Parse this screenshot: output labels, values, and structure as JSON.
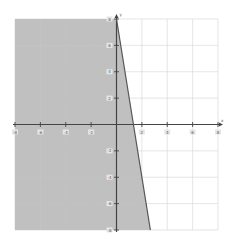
{
  "chart_data": {
    "type": "area",
    "title": "",
    "xlabel": "x",
    "ylabel": "y",
    "xlim": [
      -8,
      8
    ],
    "ylim": [
      -8,
      8
    ],
    "grid": true,
    "x_ticks": [
      -8,
      -6,
      -4,
      -2,
      2,
      4,
      6,
      8
    ],
    "y_ticks": [
      8,
      6,
      4,
      2,
      -2,
      -4,
      -6,
      -8
    ],
    "x_tick_labels": [
      "-8",
      "-6",
      "-4",
      "-2",
      "2",
      "4",
      "6",
      "8"
    ],
    "y_tick_labels": [
      "8",
      "6",
      "4",
      "2",
      "-2",
      "-4",
      "-6",
      "-8"
    ],
    "boundary_line": {
      "equation": "y = -6x + 8",
      "points": [
        [
          0,
          8
        ],
        [
          2.67,
          -8
        ]
      ],
      "style": "solid"
    },
    "shaded_region": {
      "inequality": "y <= -6x + 8",
      "side": "left"
    },
    "colors": {
      "shade": "#bdbdbd",
      "line": "#555555",
      "axis": "#444444",
      "grid": "#dddddd"
    }
  }
}
